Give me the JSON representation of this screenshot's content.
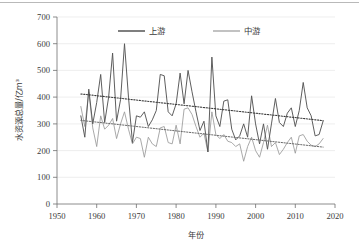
{
  "chart_data": {
    "type": "line",
    "title": "",
    "xlabel": "年份",
    "ylabel": "水资源总量/亿m³",
    "xlim": [
      1950,
      2020
    ],
    "ylim": [
      0,
      700
    ],
    "xticks": [
      "1950",
      "1960",
      "1970",
      "1980",
      "1990",
      "2000",
      "2010",
      "2020"
    ],
    "yticks": [
      "0",
      "100",
      "200",
      "300",
      "400",
      "500",
      "600",
      "700"
    ],
    "grid": "horizontal",
    "legend_position": "top-center",
    "x": [
      1956,
      1957,
      1958,
      1959,
      1960,
      1961,
      1962,
      1963,
      1964,
      1965,
      1966,
      1967,
      1968,
      1969,
      1970,
      1971,
      1972,
      1973,
      1974,
      1975,
      1976,
      1977,
      1978,
      1979,
      1980,
      1981,
      1982,
      1983,
      1984,
      1985,
      1986,
      1987,
      1988,
      1989,
      1990,
      1991,
      1992,
      1993,
      1994,
      1995,
      1996,
      1997,
      1998,
      1999,
      2000,
      2001,
      2002,
      2003,
      2004,
      2005,
      2006,
      2007,
      2008,
      2009,
      2010,
      2011,
      2012,
      2013,
      2014,
      2015,
      2016,
      2017
    ],
    "series": [
      {
        "name": "上游",
        "color": "#555555",
        "values": [
          330,
          250,
          430,
          300,
          380,
          485,
          305,
          400,
          565,
          310,
          390,
          600,
          400,
          230,
          330,
          325,
          345,
          290,
          315,
          350,
          485,
          480,
          345,
          330,
          375,
          490,
          375,
          500,
          420,
          345,
          275,
          310,
          195,
          550,
          330,
          290,
          385,
          390,
          280,
          240,
          255,
          300,
          250,
          405,
          300,
          225,
          300,
          205,
          300,
          395,
          305,
          290,
          340,
          360,
          290,
          350,
          455,
          360,
          330,
          255,
          260,
          310
        ],
        "trend": {
          "start_year": 1956,
          "start_value": 412,
          "end_year": 2017,
          "end_value": 312
        }
      },
      {
        "name": "中游",
        "color": "#9a9a9a",
        "values": [
          365,
          290,
          420,
          285,
          215,
          330,
          280,
          295,
          320,
          245,
          300,
          345,
          280,
          225,
          250,
          245,
          175,
          250,
          225,
          215,
          285,
          290,
          230,
          225,
          295,
          225,
          355,
          360,
          335,
          290,
          250,
          265,
          195,
          345,
          260,
          245,
          260,
          235,
          230,
          215,
          225,
          160,
          215,
          250,
          200,
          175,
          230,
          295,
          215,
          230,
          185,
          205,
          230,
          250,
          190,
          255,
          260,
          235,
          220,
          215,
          225,
          245
        ],
        "trend": {
          "start_year": 1956,
          "start_value": 313,
          "end_year": 2017,
          "end_value": 213
        }
      },
      {
        "name": "上游趋势线",
        "color": "#3c3c3c",
        "dotted": true
      },
      {
        "name": "中游趋势线",
        "color": "#6a6a6a",
        "dotted": true
      }
    ],
    "legend": [
      {
        "label": "上游",
        "color": "#555555"
      },
      {
        "label": "中游",
        "color": "#9a9a9a"
      }
    ]
  }
}
